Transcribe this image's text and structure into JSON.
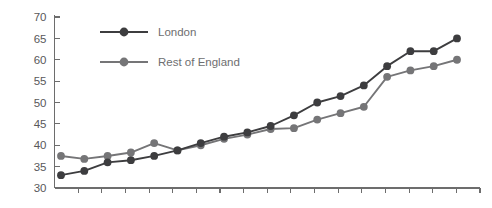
{
  "chart_data": {
    "type": "line",
    "title": "",
    "subtitle": "",
    "xlabel": "",
    "ylabel": "",
    "ylim": [
      30,
      70
    ],
    "y_ticks": [
      30,
      35,
      40,
      45,
      50,
      55,
      60,
      65,
      70
    ],
    "y_tick_labels": [
      "30",
      "35",
      "40",
      "45",
      "50",
      "55",
      "60",
      "65",
      "70"
    ],
    "x_tick_labels": [],
    "x_tick_count": 19,
    "grid": false,
    "legend_position": "upper-left-inside",
    "marker": "circle",
    "x": [
      1,
      2,
      3,
      4,
      5,
      6,
      7,
      8,
      9,
      10,
      11,
      12,
      13,
      14,
      15,
      16,
      17,
      18
    ],
    "series": [
      {
        "name": "London",
        "color": "#3d3d3f",
        "values": [
          33,
          34,
          36,
          36.5,
          37.5,
          38.8,
          40.5,
          42,
          43,
          44.5,
          47,
          50,
          51.5,
          54,
          58.5,
          62,
          62,
          65
        ]
      },
      {
        "name": "Rest of England",
        "color": "#757577",
        "values": [
          37.5,
          36.8,
          37.5,
          38.3,
          40.5,
          38.8,
          40,
          41.5,
          42.5,
          43.8,
          44,
          46,
          47.5,
          49,
          56,
          57.5,
          58.5,
          60
        ]
      }
    ]
  },
  "legend": {
    "items": [
      {
        "label": "London",
        "color": "#3d3d3f"
      },
      {
        "label": "Rest of England",
        "color": "#757577"
      }
    ]
  },
  "axis": {
    "y_labels": [
      "70",
      "65",
      "60",
      "55",
      "50",
      "45",
      "40",
      "35",
      "30"
    ]
  }
}
